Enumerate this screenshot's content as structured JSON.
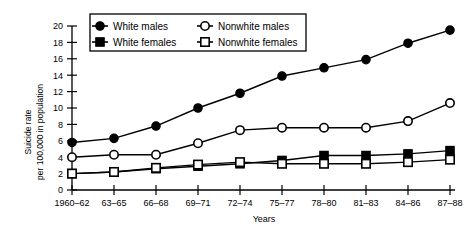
{
  "chart_data": {
    "type": "line",
    "title": "",
    "xlabel": "Years",
    "ylabel": "Suicide rate per 100,000 in population",
    "ylabel_line1": "Suicide rate",
    "ylabel_line2": "per 100,000 in population",
    "categories": [
      "1960–62",
      "63–65",
      "66–68",
      "69–71",
      "72–74",
      "75–77",
      "78–80",
      "81–83",
      "84–86",
      "87–88"
    ],
    "ylim": [
      0,
      20
    ],
    "yticks": [
      0,
      2,
      4,
      6,
      8,
      10,
      12,
      14,
      16,
      18,
      20
    ],
    "grid": false,
    "legend_position": "top-center",
    "series": [
      {
        "name": "White males",
        "marker": "filled-circle",
        "color": "#000000",
        "values": [
          5.8,
          6.3,
          7.8,
          10.0,
          11.8,
          13.9,
          14.9,
          15.9,
          17.9,
          19.5
        ]
      },
      {
        "name": "Nonwhite males",
        "marker": "open-circle",
        "color": "#000000",
        "values": [
          4.0,
          4.3,
          4.3,
          5.7,
          7.3,
          7.6,
          7.6,
          7.6,
          8.4,
          10.6
        ]
      },
      {
        "name": "White females",
        "marker": "filled-square",
        "color": "#000000",
        "values": [
          2.0,
          2.2,
          2.6,
          2.9,
          3.2,
          3.6,
          4.2,
          4.2,
          4.4,
          4.8
        ]
      },
      {
        "name": "Nonwhite females",
        "marker": "open-square",
        "color": "#000000",
        "values": [
          2.0,
          2.2,
          2.7,
          3.1,
          3.4,
          3.2,
          3.2,
          3.2,
          3.4,
          3.7
        ]
      }
    ]
  },
  "legend": {
    "items": [
      {
        "label": "White males",
        "marker": "filled-circle"
      },
      {
        "label": "Nonwhite males",
        "marker": "open-circle"
      },
      {
        "label": "White females",
        "marker": "filled-square"
      },
      {
        "label": "Nonwhite females",
        "marker": "open-square"
      }
    ]
  }
}
